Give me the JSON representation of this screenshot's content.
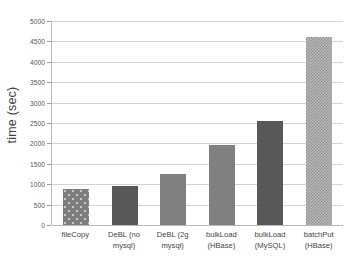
{
  "chart_data": {
    "type": "bar",
    "title": "",
    "xlabel": "",
    "ylabel": "time (sec)",
    "ylim": [
      0,
      5000
    ],
    "ytick_step": 500,
    "grid": true,
    "legend": "none",
    "categories": [
      "fileCopy",
      "DeBL (no mysql)",
      "DeBL (2g mysql)",
      "bulkLoad (HBase)",
      "bulkLoad (MySQL)",
      "batchPut (HBase)"
    ],
    "category_lines": [
      [
        "fileCopy",
        ""
      ],
      [
        "DeBL (no",
        "mysql)"
      ],
      [
        "DeBL (2g",
        "mysql)"
      ],
      [
        "bulkLoad",
        "(HBase)"
      ],
      [
        "bulkLoad",
        "(MySQL)"
      ],
      [
        "batchPut",
        "(HBase)"
      ]
    ],
    "values": [
      890,
      945,
      1250,
      1970,
      2550,
      4620
    ],
    "bar_styles": [
      "dots",
      "dark",
      "mid",
      "mid",
      "dark",
      "checker"
    ],
    "ytick_labels": [
      "5000",
      "4500",
      "4000",
      "3500",
      "3000",
      "2500",
      "2000",
      "1500",
      "1000",
      "500",
      "0"
    ],
    "ytick_values": [
      5000,
      4500,
      4000,
      3500,
      3000,
      2500,
      2000,
      1500,
      1000,
      500,
      0
    ],
    "colors": {
      "bar_dark": "#585858",
      "bar_mid": "#808080",
      "bar_dots": "#7d7d7d",
      "bar_checker": "#b9b9b9",
      "gridline": "#d4d4d4",
      "axis": "#b9b9b9",
      "text": "#3f3f3f",
      "background": "#ffffff"
    }
  }
}
